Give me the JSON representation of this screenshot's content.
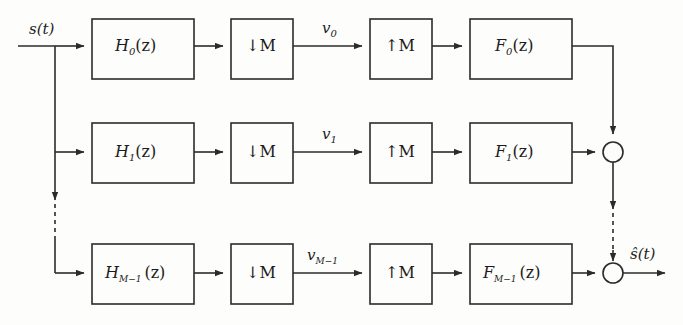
{
  "figure": {
    "kind": "block-diagram",
    "background_color": "#fdfdfb",
    "line_color": "#2b2b2b"
  },
  "signals": {
    "input_label": "s(t)",
    "output_label": "ŝ(t)"
  },
  "rows": [
    {
      "index": 0,
      "analysis_filter": "H",
      "analysis_sub": "0",
      "analysis_arg": "(z)",
      "downsampler": "↓M",
      "subband": "v",
      "subband_sub": "0",
      "upsampler": "↑M",
      "synthesis_filter": "F",
      "synthesis_sub": "0",
      "synthesis_arg": "(z)"
    },
    {
      "index": 1,
      "analysis_filter": "H",
      "analysis_sub": "1",
      "analysis_arg": "(z)",
      "downsampler": "↓M",
      "subband": "v",
      "subband_sub": "1",
      "upsampler": "↑M",
      "synthesis_filter": "F",
      "synthesis_sub": "1",
      "synthesis_arg": "(z)"
    },
    {
      "index": 2,
      "analysis_filter": "H",
      "analysis_sub": "M−1",
      "analysis_arg": "(z)",
      "downsampler": "↓M",
      "subband": "v",
      "subband_sub": "M−1",
      "upsampler": "↑M",
      "synthesis_filter": "F",
      "synthesis_sub": "M−1",
      "synthesis_arg": "(z)"
    }
  ],
  "adders": {
    "count": 2,
    "symbol": ""
  },
  "ellipsis": {
    "input_bus": "dashed vertical continuation",
    "output_bus": "dashed vertical continuation"
  }
}
